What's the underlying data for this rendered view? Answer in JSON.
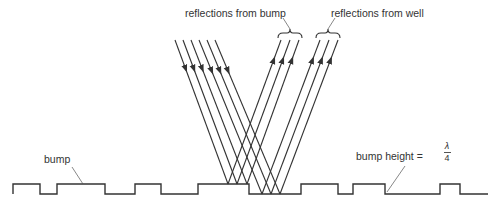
{
  "diagram": {
    "title": "",
    "labels": {
      "reflections_bump": "reflections from bump",
      "reflections_well": "reflections from well",
      "bump": "bump",
      "bump_height_prefix": "bump height =",
      "bump_height_numerator": "λ",
      "bump_height_denominator": "4"
    },
    "profile": {
      "top_y": 184,
      "bottom_y": 194,
      "points": [
        [
          13,
          194
        ],
        [
          13,
          184
        ],
        [
          40,
          184
        ],
        [
          40,
          194
        ],
        [
          57,
          194
        ],
        [
          57,
          184
        ],
        [
          105,
          184
        ],
        [
          105,
          194
        ],
        [
          135,
          194
        ],
        [
          135,
          184
        ],
        [
          161,
          184
        ],
        [
          161,
          194
        ],
        [
          198,
          194
        ],
        [
          198,
          184
        ],
        [
          249,
          184
        ],
        [
          249,
          194
        ],
        [
          301,
          194
        ],
        [
          301,
          184
        ],
        [
          338,
          184
        ],
        [
          338,
          194
        ],
        [
          353,
          194
        ],
        [
          353,
          184
        ],
        [
          385,
          184
        ],
        [
          385,
          194
        ],
        [
          440,
          194
        ],
        [
          440,
          184
        ],
        [
          460,
          184
        ],
        [
          460,
          194
        ],
        [
          488,
          194
        ]
      ]
    },
    "incoming_rays": [
      {
        "x1": 175,
        "y1": 40,
        "x2": 228,
        "y2": 184
      },
      {
        "x1": 183,
        "y1": 40,
        "x2": 237,
        "y2": 184
      },
      {
        "x1": 191,
        "y1": 40,
        "x2": 247,
        "y2": 184
      },
      {
        "x1": 199,
        "y1": 40,
        "x2": 262,
        "y2": 194
      },
      {
        "x1": 207,
        "y1": 40,
        "x2": 271,
        "y2": 194
      },
      {
        "x1": 215,
        "y1": 40,
        "x2": 280,
        "y2": 194
      }
    ],
    "outgoing_rays": [
      {
        "x1": 228,
        "y1": 184,
        "x2": 281,
        "y2": 40
      },
      {
        "x1": 237,
        "y1": 184,
        "x2": 290,
        "y2": 40
      },
      {
        "x1": 247,
        "y1": 184,
        "x2": 299,
        "y2": 40
      },
      {
        "x1": 262,
        "y1": 194,
        "x2": 320,
        "y2": 40
      },
      {
        "x1": 271,
        "y1": 194,
        "x2": 329,
        "y2": 40
      },
      {
        "x1": 280,
        "y1": 194,
        "x2": 338,
        "y2": 40
      }
    ],
    "colors": {
      "line": "#333333",
      "text": "#333333"
    }
  }
}
